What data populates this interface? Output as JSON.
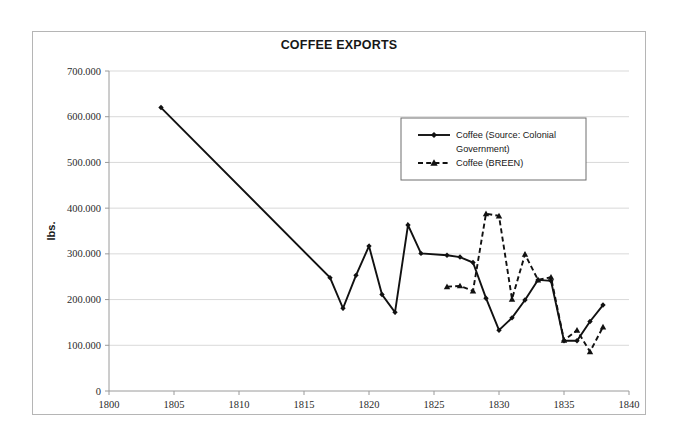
{
  "chart_data": {
    "type": "line",
    "title": "COFFEE EXPORTS",
    "xlabel": "",
    "ylabel": "lbs.",
    "xlim": [
      1800,
      1840
    ],
    "ylim": [
      0,
      700000
    ],
    "xticks": [
      1800,
      1805,
      1810,
      1815,
      1820,
      1825,
      1830,
      1835,
      1840
    ],
    "xtick_labels": [
      "1800",
      "1805",
      "1810",
      "1815",
      "1820",
      "1825",
      "1830",
      "1835",
      "1840"
    ],
    "yticks": [
      0,
      100000,
      200000,
      300000,
      400000,
      500000,
      600000,
      700000
    ],
    "ytick_labels": [
      "0",
      "100.000",
      "200.000",
      "300.000",
      "400.000",
      "500.000",
      "600.000",
      "700.000"
    ],
    "grid": true,
    "legend_position": "upper-right-inside",
    "series": [
      {
        "name": "Coffee (Source: Colonial Government)",
        "line_style": "solid",
        "marker": "diamond",
        "color": "#111111",
        "x": [
          1804,
          1817,
          1818,
          1819,
          1820,
          1821,
          1822,
          1823,
          1824,
          1826,
          1827,
          1828,
          1829,
          1830,
          1831,
          1832,
          1833,
          1834,
          1835,
          1836,
          1837,
          1838
        ],
        "values": [
          620000,
          248000,
          181000,
          253000,
          317000,
          211000,
          172000,
          363000,
          301000,
          297000,
          293000,
          281000,
          203000,
          133000,
          160000,
          199000,
          243000,
          241000,
          110000,
          110000,
          152000,
          188000
        ]
      },
      {
        "name": "Coffee (BREEN)",
        "line_style": "dashed",
        "marker": "triangle",
        "color": "#111111",
        "x": [
          1826,
          1827,
          1828,
          1829,
          1830,
          1831,
          1832,
          1833,
          1834,
          1835,
          1836,
          1837,
          1838
        ],
        "values": [
          228000,
          230000,
          219000,
          388000,
          383000,
          201000,
          299000,
          243000,
          249000,
          111000,
          133000,
          86000,
          140000
        ]
      }
    ]
  },
  "legend": {
    "entries": [
      {
        "label": "Coffee (Source: Colonial Government)",
        "line_style": "solid",
        "marker": "diamond"
      },
      {
        "label": "Coffee (BREEN)",
        "line_style": "dashed",
        "marker": "triangle"
      }
    ]
  }
}
